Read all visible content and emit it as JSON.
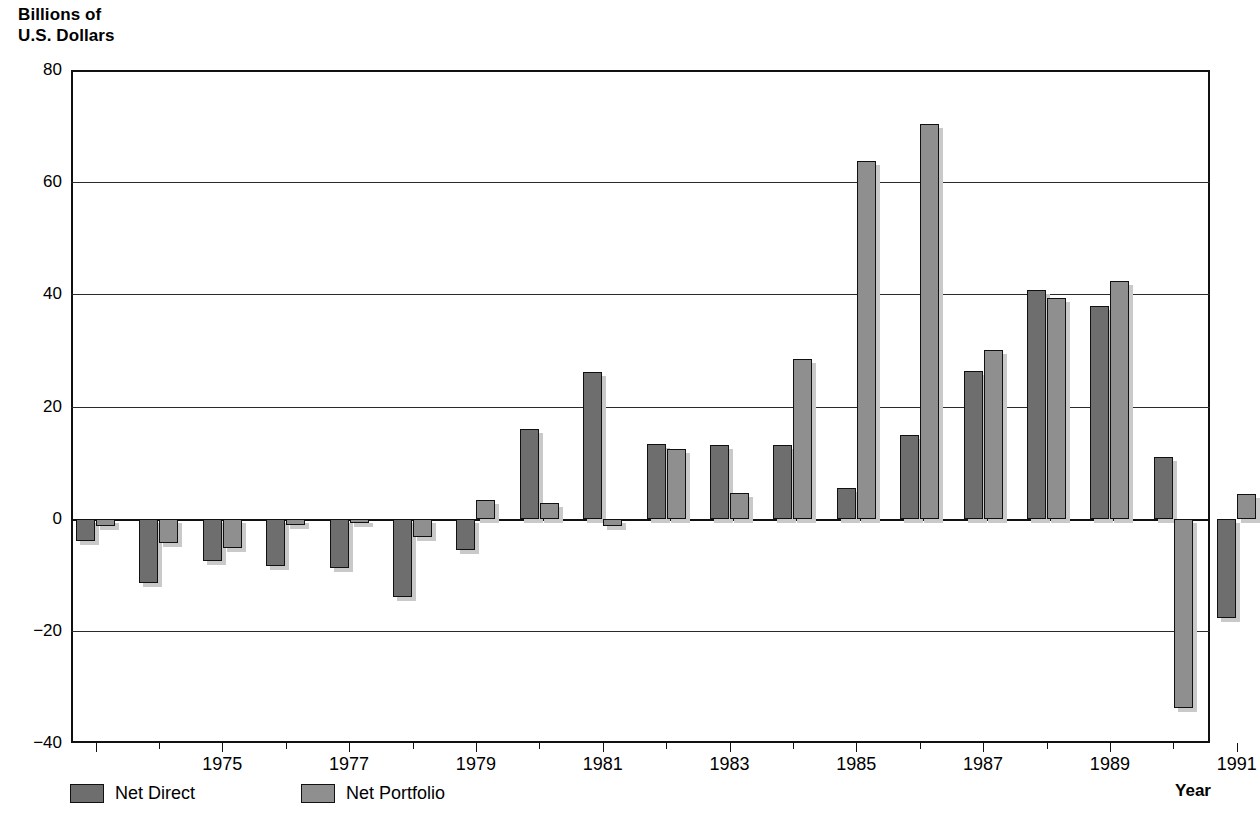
{
  "axis_title_y": "Billions of\nU.S. Dollars",
  "axis_title_x": "Year",
  "y_ticks": [
    "80",
    "60",
    "40",
    "20",
    "0",
    "−20",
    "−40"
  ],
  "x_tick_labels": [
    "1975",
    "1977",
    "1979",
    "1981",
    "1983",
    "1985",
    "1987",
    "1989",
    "1991"
  ],
  "legend": {
    "items": [
      {
        "label": "Net Direct",
        "color": "#6e6e6e",
        "key": "net_direct"
      },
      {
        "label": "Net Portfolio",
        "color": "#8f8f8f",
        "key": "net_portfolio"
      }
    ]
  },
  "chart_data": {
    "type": "bar",
    "title": "Billions of U.S. Dollars",
    "xlabel": "Year",
    "ylabel": "Billions of U.S. Dollars",
    "ylim": [
      -40,
      80
    ],
    "ytick_values": [
      80,
      60,
      40,
      20,
      0,
      -20,
      -40
    ],
    "grid": true,
    "legend_position": "bottom-left",
    "categories": [
      1973,
      1974,
      1975,
      1976,
      1977,
      1978,
      1979,
      1980,
      1981,
      1982,
      1983,
      1984,
      1985,
      1986,
      1987,
      1988,
      1989,
      1990,
      1991
    ],
    "xtick_labels": [
      "1975",
      "1977",
      "1979",
      "1981",
      "1983",
      "1985",
      "1987",
      "1989",
      "1991"
    ],
    "series": [
      {
        "name": "Net Direct",
        "color": "#6e6e6e",
        "values": [
          -4.0,
          -11.5,
          -7.5,
          -8.5,
          -8.8,
          -14.0,
          -5.5,
          15.9,
          26.2,
          13.3,
          13.2,
          5.4,
          15.0,
          26.4,
          40.7,
          38.0,
          11.0,
          -17.8,
          null
        ]
      },
      {
        "name": "Net Portfolio",
        "color": "#8f8f8f",
        "values": [
          -1.3,
          -4.3,
          -5.2,
          -1.2,
          -0.8,
          -3.3,
          3.3,
          2.8,
          -1.3,
          4.6,
          28.4,
          63.7,
          70.4,
          30.0,
          39.3,
          42.4,
          -33.8,
          4.4,
          null
        ]
      }
    ],
    "paired_values": [
      {
        "year": 1973,
        "net_direct": -4.0,
        "net_portfolio": -1.3
      },
      {
        "year": 1974,
        "net_direct": -11.5,
        "net_portfolio": -4.3
      },
      {
        "year": 1975,
        "net_direct": -7.5,
        "net_portfolio": -5.2
      },
      {
        "year": 1976,
        "net_direct": -8.5,
        "net_portfolio": -1.2
      },
      {
        "year": 1977,
        "net_direct": -8.8,
        "net_portfolio": -0.8
      },
      {
        "year": 1978,
        "net_direct": -14.0,
        "net_portfolio": -3.3
      },
      {
        "year": 1979,
        "net_direct": -5.5,
        "net_portfolio": 3.3
      },
      {
        "year": 1980,
        "net_direct": 15.9,
        "net_portfolio": 2.8
      },
      {
        "year": 1981,
        "net_direct": 26.2,
        "net_portfolio": -1.3
      },
      {
        "year": 1982,
        "net_direct": 13.3,
        "net_portfolio": 12.4
      },
      {
        "year": 1983,
        "net_direct": 13.2,
        "net_portfolio": 4.6
      },
      {
        "year": 1984,
        "net_direct": 13.2,
        "net_portfolio": 28.4
      },
      {
        "year": 1985,
        "net_direct": 5.4,
        "net_portfolio": 63.7
      },
      {
        "year": 1986,
        "net_direct": 15.0,
        "net_portfolio": 70.4
      },
      {
        "year": 1987,
        "net_direct": 26.4,
        "net_portfolio": 30.0
      },
      {
        "year": 1988,
        "net_direct": 40.7,
        "net_portfolio": 39.3
      },
      {
        "year": 1989,
        "net_direct": 38.0,
        "net_portfolio": 42.4
      },
      {
        "year": 1990,
        "net_direct": 11.0,
        "net_portfolio": -33.8
      },
      {
        "year": 1991,
        "net_direct": -17.8,
        "net_portfolio": 4.4
      }
    ]
  },
  "geometry": {
    "plot_left": 71,
    "plot_top": 70,
    "plot_width": 1139,
    "plot_height": 673,
    "zero_y": 447,
    "unit_px": 5.585,
    "first_pair_x": 0,
    "pair_pitch": 63.4,
    "bar_width": 19,
    "bar_gap": 1
  }
}
